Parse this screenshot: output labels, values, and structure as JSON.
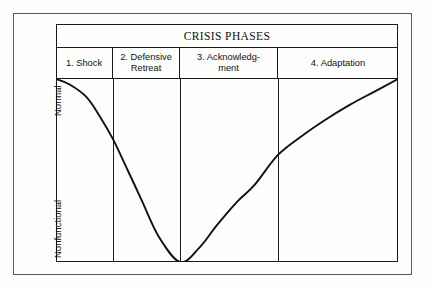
{
  "figure": {
    "title": "CRISIS PHASES",
    "phases": [
      {
        "label": "1. Shock",
        "line1": "1. Shock",
        "line2": ""
      },
      {
        "label": "2. Defensive Retreat",
        "line1": "2. Defensive",
        "line2": "Retreat"
      },
      {
        "label": "3. Acknowledgment",
        "line1": "3. Acknowledg-",
        "line2": "ment"
      },
      {
        "label": "4. Adaptation",
        "line1": "4. Adaptation",
        "line2": ""
      }
    ],
    "axis": {
      "y_top_label": "Normal",
      "y_bottom_label": "Nonfunctional"
    },
    "colors": {
      "line": "#111111",
      "border": "#1a1a1a",
      "outer_frame": "#5a5a5a",
      "background": "#fdfdfc"
    }
  },
  "chart_data": {
    "type": "line",
    "title": "CRISIS PHASES",
    "xlabel": "",
    "ylabel": "",
    "grid": false,
    "legend": "none",
    "ylim": [
      0,
      1
    ],
    "ytick_labels": [
      "Nonfunctional",
      "Normal"
    ],
    "ytick_values": [
      0,
      1
    ],
    "categories": [
      "1. Shock",
      "2. Defensive Retreat",
      "3. Acknowledgment",
      "4. Adaptation"
    ],
    "category_boundaries": [
      0.0,
      0.167,
      0.363,
      0.649,
      1.0
    ],
    "series": [
      {
        "name": "Level of functioning",
        "x": [
          0.0,
          0.04,
          0.09,
          0.13,
          0.167,
          0.21,
          0.25,
          0.3,
          0.363,
          0.42,
          0.47,
          0.53,
          0.58,
          0.649,
          0.72,
          0.79,
          0.86,
          0.93,
          1.0
        ],
        "values": [
          1.0,
          0.97,
          0.9,
          0.79,
          0.67,
          0.5,
          0.34,
          0.14,
          0.0,
          0.08,
          0.2,
          0.33,
          0.42,
          0.585,
          0.69,
          0.78,
          0.86,
          0.93,
          1.0
        ]
      }
    ],
    "annotations": [
      "Curve starts at Normal, bottoms out at Nonfunctional at the boundary between phase 2 and phase 3, then recovers to Normal by the end of phase 4."
    ]
  }
}
